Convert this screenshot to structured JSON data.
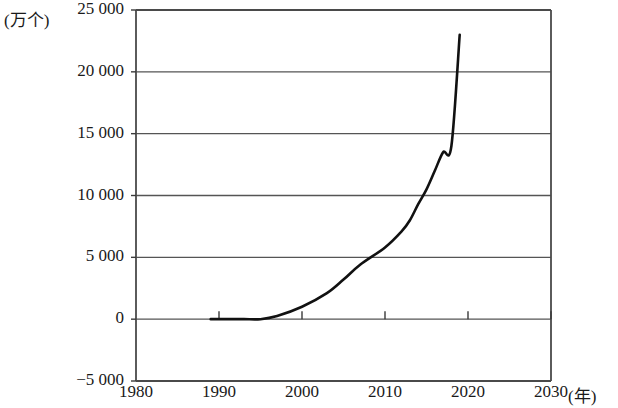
{
  "chart_data": {
    "type": "line",
    "title": "",
    "subtitle": "",
    "xlabel": "(年)",
    "ylabel": "(万个)",
    "y_unit_label": "(万个)",
    "x_unit_label": "(年)",
    "xlim": [
      1980,
      2030
    ],
    "ylim": [
      -5000,
      25000
    ],
    "grid": "horizontal",
    "legend": "none",
    "y_ticks": [
      {
        "value": 25000,
        "label": "25 000"
      },
      {
        "value": 20000,
        "label": "20 000"
      },
      {
        "value": 15000,
        "label": "15 000"
      },
      {
        "value": 10000,
        "label": "10 000"
      },
      {
        "value": 5000,
        "label": "5 000"
      },
      {
        "value": 0,
        "label": "0"
      },
      {
        "value": -5000,
        "label": "−5 000"
      }
    ],
    "x_ticks": [
      {
        "value": 1980,
        "label": "1980"
      },
      {
        "value": 1990,
        "label": "1990"
      },
      {
        "value": 2000,
        "label": "2000"
      },
      {
        "value": 2010,
        "label": "2010"
      },
      {
        "value": 2020,
        "label": "2020"
      },
      {
        "value": 2030,
        "label": "2030"
      }
    ],
    "gridline_values": [
      20000,
      15000,
      10000,
      5000,
      0
    ],
    "series": [
      {
        "name": "数量",
        "color": "#111111",
        "x": [
          1989,
          1991,
          1993,
          1995,
          1997,
          2000,
          2003,
          2005,
          2007,
          2010,
          2012,
          2013,
          2014,
          2015,
          2016,
          2017,
          2018,
          2019
        ],
        "values": [
          0,
          0,
          0,
          0,
          250,
          1000,
          2100,
          3200,
          4400,
          5800,
          7100,
          8000,
          9300,
          10500,
          12000,
          13500,
          14000,
          23000
        ]
      }
    ]
  }
}
